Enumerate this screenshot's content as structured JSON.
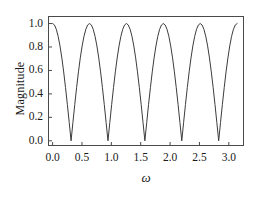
{
  "chart_data": {
    "type": "line",
    "title": "",
    "subtitle": "",
    "xlabel": "ω",
    "ylabel": "Magnitude",
    "xlim": [
      -0.07,
      3.25
    ],
    "ylim": [
      -0.04,
      1.06
    ],
    "xticks": [
      0.0,
      0.5,
      1.0,
      1.5,
      2.0,
      2.5,
      3.0
    ],
    "xtick_labels": [
      "0.0",
      "0.5",
      "1.0",
      "1.5",
      "2.0",
      "2.5",
      "3.0"
    ],
    "yticks": [
      0.0,
      0.2,
      0.4,
      0.6,
      0.8,
      1.0
    ],
    "ytick_labels": [
      "0.0",
      "0.2",
      "0.4",
      "0.6",
      "0.8",
      "1.0"
    ],
    "grid": false,
    "legend": "none",
    "frame": true,
    "line_color": "#3c3c3c",
    "line_width": 1.0,
    "background_color": "#ffffff",
    "formula": "abs(cos(5*omega))",
    "series": [
      {
        "name": "Magnitude",
        "x": [
          0.0,
          0.0314,
          0.0628,
          0.0942,
          0.1257,
          0.1571,
          0.1885,
          0.2199,
          0.2513,
          0.2827,
          0.3142,
          0.3456,
          0.377,
          0.4084,
          0.4398,
          0.4712,
          0.5027,
          0.5341,
          0.5655,
          0.5969,
          0.6283,
          0.6597,
          0.6912,
          0.7226,
          0.754,
          0.7854,
          0.8168,
          0.8482,
          0.8796,
          0.9111,
          0.9425,
          0.9739,
          1.0053,
          1.0367,
          1.0681,
          1.0996,
          1.131,
          1.1624,
          1.1938,
          1.2252,
          1.2566,
          1.2881,
          1.3195,
          1.3509,
          1.3823,
          1.4137,
          1.4451,
          1.4765,
          1.508,
          1.5394,
          1.5708,
          1.6022,
          1.6336,
          1.665,
          1.6965,
          1.7279,
          1.7593,
          1.7907,
          1.8221,
          1.8535,
          1.885,
          1.9164,
          1.9478,
          1.9792,
          2.0106,
          2.042,
          2.0735,
          2.1049,
          2.1363,
          2.1677,
          2.1991,
          2.2305,
          2.2619,
          2.2934,
          2.3248,
          2.3562,
          2.3876,
          2.419,
          2.4504,
          2.4819,
          2.5133,
          2.5447,
          2.5761,
          2.6075,
          2.6389,
          2.6704,
          2.7018,
          2.7332,
          2.7646,
          2.796,
          2.8274,
          2.8588,
          2.8903,
          2.9217,
          2.9531,
          2.9845,
          3.0159,
          3.0473,
          3.0788,
          3.1102,
          3.1416
        ],
        "y": [
          1.0,
          0.9877,
          0.9511,
          0.891,
          0.809,
          0.7071,
          0.5878,
          0.454,
          0.309,
          0.1564,
          0.0,
          0.1564,
          0.309,
          0.454,
          0.5878,
          0.7071,
          0.809,
          0.891,
          0.9511,
          0.9877,
          1.0,
          0.9877,
          0.9511,
          0.891,
          0.809,
          0.7071,
          0.5878,
          0.454,
          0.309,
          0.1564,
          0.0,
          0.1564,
          0.309,
          0.454,
          0.5878,
          0.7071,
          0.809,
          0.891,
          0.9511,
          0.9877,
          1.0,
          0.9877,
          0.9511,
          0.891,
          0.809,
          0.7071,
          0.5878,
          0.454,
          0.309,
          0.1564,
          0.0,
          0.1564,
          0.309,
          0.454,
          0.5878,
          0.7071,
          0.809,
          0.891,
          0.9511,
          0.9877,
          1.0,
          0.9877,
          0.9511,
          0.891,
          0.809,
          0.7071,
          0.5878,
          0.454,
          0.309,
          0.1564,
          0.0,
          0.1564,
          0.309,
          0.454,
          0.5878,
          0.7071,
          0.809,
          0.891,
          0.9511,
          0.9877,
          1.0,
          0.9877,
          0.9511,
          0.891,
          0.809,
          0.7071,
          0.5878,
          0.454,
          0.309,
          0.1564,
          0.0,
          0.1564,
          0.309,
          0.454,
          0.5878,
          0.7071,
          0.809,
          0.891,
          0.9511,
          0.9877,
          1.0
        ]
      }
    ],
    "minima_x": [
      0.3142,
      0.9425,
      1.5708,
      2.1991,
      2.8274
    ],
    "maxima_x": [
      0.0,
      0.6283,
      1.2566,
      1.885,
      2.5133,
      3.1416
    ],
    "minima_y": 0.0,
    "maxima_y": 1.0
  }
}
